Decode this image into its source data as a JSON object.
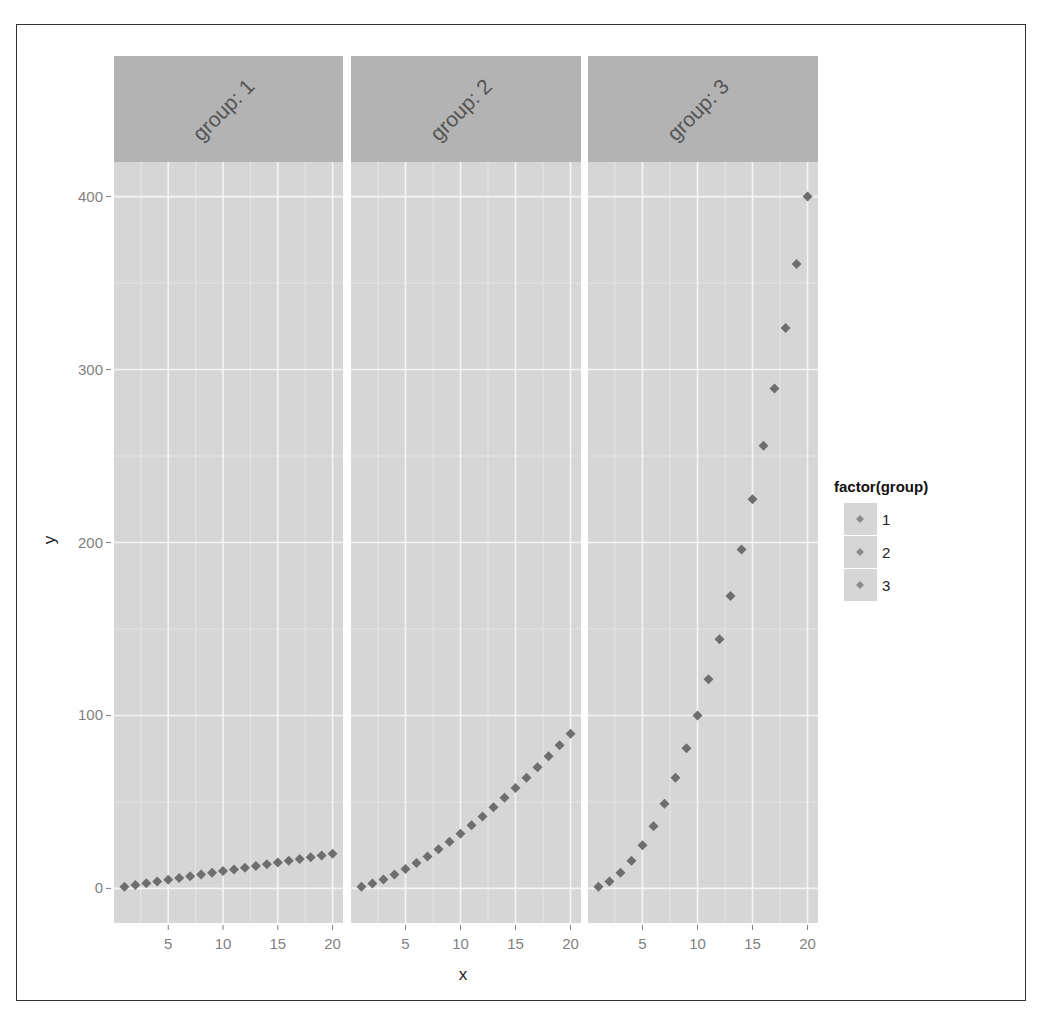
{
  "chart_data": {
    "type": "scatter",
    "title": "",
    "xlabel": "x",
    "ylabel": "y",
    "facet_var": "group",
    "facets": [
      "group: 1",
      "group: 2",
      "group: 3"
    ],
    "x_ticks": [
      5,
      10,
      15,
      20
    ],
    "y_ticks": [
      0,
      100,
      200,
      300,
      400
    ],
    "xlim": [
      0.05,
      20.95
    ],
    "ylim": [
      -20,
      420
    ],
    "grid": true,
    "legend": {
      "title": "factor(group)",
      "entries": [
        "1",
        "2",
        "3"
      ],
      "position": "right"
    },
    "x": [
      1,
      2,
      3,
      4,
      5,
      6,
      7,
      8,
      9,
      10,
      11,
      12,
      13,
      14,
      15,
      16,
      17,
      18,
      19,
      20
    ],
    "series": [
      {
        "name": "1",
        "values": [
          1,
          2,
          3,
          4,
          5,
          6,
          7,
          8,
          9,
          10,
          11,
          12,
          13,
          14,
          15,
          16,
          17,
          18,
          19,
          20
        ]
      },
      {
        "name": "2",
        "values": [
          1,
          2.8,
          5.2,
          8,
          11.2,
          14.7,
          18.5,
          22.6,
          27,
          31.6,
          36.5,
          41.6,
          46.9,
          52.4,
          58.1,
          64,
          70.1,
          76.4,
          82.8,
          89.4
        ]
      },
      {
        "name": "3",
        "values": [
          1,
          4,
          9,
          16,
          25,
          36,
          49,
          64,
          81,
          100,
          121,
          144,
          169,
          196,
          225,
          256,
          289,
          324,
          361,
          400
        ]
      }
    ]
  },
  "colors": {
    "panel_bg": "#d6d6d6",
    "strip_bg": "#b3b3b3",
    "grid_major": "#f4f4f4",
    "grid_minor": "#e4e4e4",
    "point": "#6e6e6e"
  }
}
